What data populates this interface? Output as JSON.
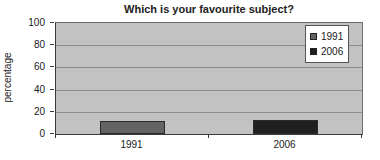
{
  "chart_data": {
    "type": "bar",
    "title": "Which is your favourite subject?",
    "xlabel": "",
    "ylabel": "percentage",
    "ylim": [
      0,
      100
    ],
    "yticks": [
      0,
      20,
      40,
      60,
      80,
      100
    ],
    "categories": [
      "1991",
      "2006"
    ],
    "series": [
      {
        "name": "1991",
        "color": "#636363",
        "values": [
          12,
          null
        ]
      },
      {
        "name": "2006",
        "color": "#1f1f1f",
        "values": [
          null,
          13
        ]
      }
    ],
    "legend": {
      "position": "top-right",
      "entries": [
        {
          "label": "1991",
          "color": "#636363"
        },
        {
          "label": "2006",
          "color": "#1f1f1f"
        }
      ]
    },
    "grid": true,
    "plot_bg": "#c2c2c2",
    "gridline_color": "#8c8c8c",
    "axis_color": "#3a3a3a"
  }
}
